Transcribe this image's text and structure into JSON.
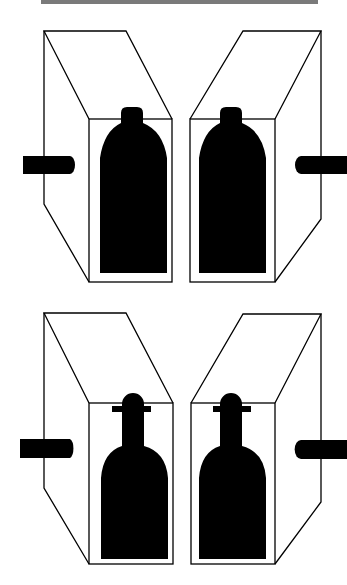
{
  "diagram": {
    "colors": {
      "ink": "#000000",
      "background": "#ffffff",
      "top_bar": "#7a7a7a"
    },
    "panels": [
      {
        "id": "top-left",
        "bottle": "rounded-cylinder",
        "rod_side": "left"
      },
      {
        "id": "top-right",
        "bottle": "rounded-cylinder",
        "rod_side": "right"
      },
      {
        "id": "bottom-left",
        "bottle": "round-shouldered-with-collar",
        "rod_side": "left"
      },
      {
        "id": "bottom-right",
        "bottle": "round-shouldered-with-collar",
        "rod_side": "right"
      }
    ]
  }
}
